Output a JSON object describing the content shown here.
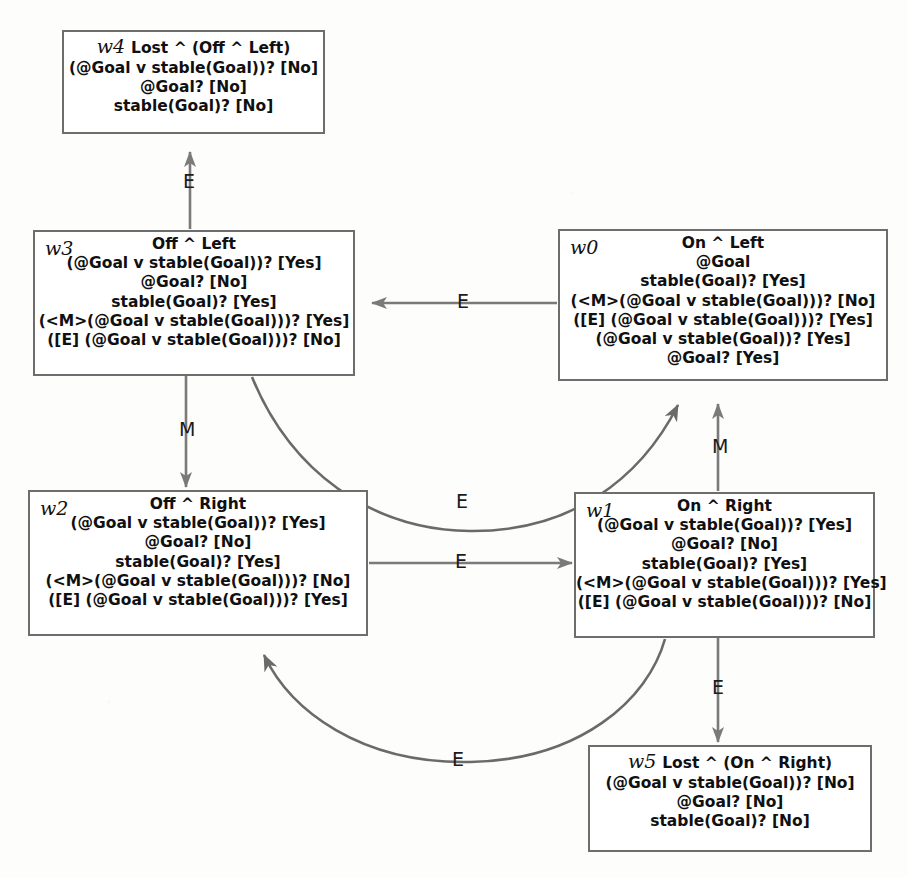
{
  "diagram": {
    "colors": {
      "box_border": "#6d6d6d",
      "edge_stroke": "#7a7a7a",
      "curve_stroke": "#6a6a6a",
      "text": "#101010",
      "background": "#fdfdfc"
    },
    "states": [
      {
        "id": "w4",
        "header": "Lost ^ (Off ^ Left)",
        "id_inline": true,
        "lines": [
          "(@Goal v stable(Goal))? [No]",
          "@Goal? [No]",
          "stable(Goal)? [No]"
        ]
      },
      {
        "id": "w3",
        "header": "Off ^ Left",
        "id_inline": false,
        "lines": [
          "(@Goal v stable(Goal))? [Yes]",
          "@Goal? [No]",
          "stable(Goal)? [Yes]",
          "(<M>(@Goal v stable(Goal)))? [Yes]",
          "([E] (@Goal v stable(Goal)))? [No]"
        ]
      },
      {
        "id": "w0",
        "header": "On ^ Left",
        "id_inline": false,
        "lines": [
          "@Goal",
          "stable(Goal)? [Yes]",
          "(<M>(@Goal v stable(Goal)))? [No]",
          "([E] (@Goal v stable(Goal)))? [Yes]",
          "(@Goal v stable(Goal))? [Yes]",
          "@Goal? [Yes]"
        ]
      },
      {
        "id": "w2",
        "header": "Off ^ Right",
        "id_inline": false,
        "lines": [
          "(@Goal v stable(Goal))? [Yes]",
          "@Goal? [No]",
          "stable(Goal)? [Yes]",
          "(<M>(@Goal v stable(Goal)))? [No]",
          "([E] (@Goal v stable(Goal)))? [Yes]"
        ]
      },
      {
        "id": "w1",
        "header": "On ^ Right",
        "id_inline": false,
        "lines": [
          "(@Goal v stable(Goal))? [Yes]",
          "@Goal? [No]",
          "stable(Goal)? [Yes]",
          "(<M>(@Goal v stable(Goal)))? [Yes]",
          "([E] (@Goal v stable(Goal)))? [No]"
        ]
      },
      {
        "id": "w5",
        "header": "Lost ^ (On ^ Right)",
        "id_inline": true,
        "lines": [
          "(@Goal v stable(Goal))? [No]",
          "@Goal? [No]",
          "stable(Goal)? [No]"
        ]
      }
    ],
    "transitions": [
      {
        "from": "w3",
        "to": "w4",
        "label": "E",
        "shape": "straight-up"
      },
      {
        "from": "w0",
        "to": "w3",
        "label": "E",
        "shape": "straight-left"
      },
      {
        "from": "w3",
        "to": "w2",
        "label": "M",
        "shape": "straight-down"
      },
      {
        "from": "w3",
        "to": "w0",
        "label": "E",
        "shape": "curve-right-up"
      },
      {
        "from": "w2",
        "to": "w1",
        "label": "E",
        "shape": "straight-right"
      },
      {
        "from": "w1",
        "to": "w0",
        "label": "M",
        "shape": "straight-up"
      },
      {
        "from": "w1",
        "to": "w5",
        "label": "E",
        "shape": "straight-down"
      },
      {
        "from": "w1",
        "to": "w2",
        "label": "E",
        "shape": "curve-left-up"
      }
    ]
  }
}
